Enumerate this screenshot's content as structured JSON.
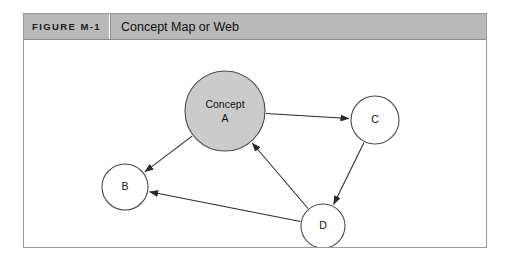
{
  "figure": {
    "number_label": "FIGURE M-1",
    "caption": "Concept Map or Web"
  },
  "colors": {
    "header_background": "#b9b9b9",
    "frame_border": "#9a9a9a",
    "canvas_background": "#ffffff",
    "major_node_fill": "#cbcbcb",
    "minor_node_fill": "#ffffff",
    "node_stroke": "#4a4a4a",
    "edge_stroke": "#2a2a2a",
    "text": "#111111"
  },
  "chart_data": {
    "type": "diagram",
    "title": "Concept Map or Web",
    "nodes": [
      {
        "id": "A",
        "label_line1": "Concept",
        "label_line2": "A",
        "cx": 201,
        "cy": 71,
        "r": 40,
        "emphasis": "filled"
      },
      {
        "id": "C",
        "label_line1": "C",
        "label_line2": "",
        "cx": 351,
        "cy": 80,
        "r": 24,
        "emphasis": "outline"
      },
      {
        "id": "B",
        "label_line1": "B",
        "label_line2": "",
        "cx": 101,
        "cy": 147,
        "r": 23,
        "emphasis": "outline"
      },
      {
        "id": "D",
        "label_line1": "D",
        "label_line2": "",
        "cx": 299,
        "cy": 186,
        "r": 22,
        "emphasis": "outline"
      }
    ],
    "edges": [
      {
        "from": "A",
        "to": "C",
        "directed": true
      },
      {
        "from": "A",
        "to": "B",
        "directed": true
      },
      {
        "from": "C",
        "to": "D",
        "directed": true
      },
      {
        "from": "D",
        "to": "B",
        "directed": true
      },
      {
        "from": "D",
        "to": "A",
        "directed": true
      }
    ]
  }
}
